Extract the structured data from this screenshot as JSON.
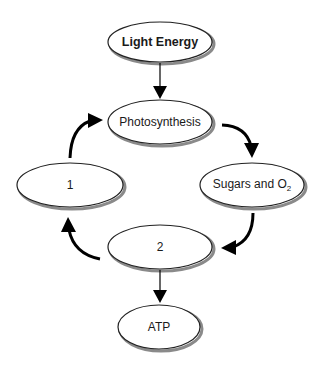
{
  "diagram": {
    "title": "",
    "colors": {
      "stroke": "#222222",
      "fill": "#ffffff",
      "shadow": "#8a8a8a",
      "arrow": "#000000"
    },
    "nodes": [
      {
        "id": "light_energy",
        "label": "Light Energy",
        "bold": true,
        "cx": 160,
        "cy": 42,
        "rx": 52,
        "ry": 20
      },
      {
        "id": "photosynthesis",
        "label": "Photosynthesis",
        "bold": false,
        "cx": 160,
        "cy": 122,
        "rx": 52,
        "ry": 22
      },
      {
        "id": "node_1",
        "label": "1",
        "bold": false,
        "cx": 70,
        "cy": 185,
        "rx": 53,
        "ry": 22
      },
      {
        "id": "sugars_o2",
        "label": "Sugars and O",
        "label_sub": "2",
        "bold": false,
        "cx": 252,
        "cy": 185,
        "rx": 52,
        "ry": 22
      },
      {
        "id": "node_2",
        "label": "2",
        "bold": false,
        "cx": 160,
        "cy": 247,
        "rx": 52,
        "ry": 22
      },
      {
        "id": "atp",
        "label": "ATP",
        "bold": false,
        "cx": 159,
        "cy": 327,
        "rx": 41,
        "ry": 22
      }
    ],
    "edges": [
      {
        "from": "light_energy",
        "to": "photosynthesis",
        "style": "straight"
      },
      {
        "from": "photosynthesis",
        "to": "sugars_o2",
        "style": "curved"
      },
      {
        "from": "sugars_o2",
        "to": "node_2",
        "style": "curved"
      },
      {
        "from": "node_2",
        "to": "node_1",
        "style": "curved"
      },
      {
        "from": "node_1",
        "to": "photosynthesis",
        "style": "curved"
      },
      {
        "from": "node_2",
        "to": "atp",
        "style": "straight"
      }
    ],
    "labels": {
      "light_energy": "Light Energy",
      "photosynthesis": "Photosynthesis",
      "node_1": "1",
      "sugars_o2": "Sugars and O",
      "sugars_o2_sub": "2",
      "node_2": "2",
      "atp": "ATP"
    }
  }
}
